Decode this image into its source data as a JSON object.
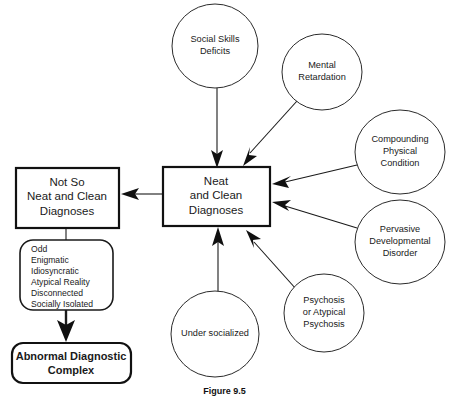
{
  "figure": {
    "caption": "Figure 9.5"
  },
  "nodes": {
    "center": {
      "id": "neat-and-clean-diagnoses",
      "shape": "rectangle",
      "lines": [
        "Neat",
        "and Clean",
        "Diagnoses"
      ]
    },
    "not_so": {
      "id": "not-so-neat-and-clean-diagnoses",
      "shape": "rectangle",
      "lines": [
        "Not So",
        "Neat and Clean",
        "Diagnoses"
      ]
    },
    "descriptors": {
      "id": "descriptor-list",
      "shape": "rounded-rectangle",
      "items": [
        "Odd",
        "Enigmatic",
        "Idiosyncratic",
        "Atypical Reality",
        "Disconnected",
        "Socially Isolated"
      ]
    },
    "outcome": {
      "id": "abnormal-diagnostic-complex",
      "shape": "rounded-rectangle",
      "lines": [
        "Abnormal Diagnostic",
        "Complex"
      ]
    },
    "circles": [
      {
        "id": "social-skills-deficits",
        "lines": [
          "Social Skills",
          "Deficits"
        ],
        "cx": 215,
        "cy": 46,
        "rx": 43,
        "ry": 42
      },
      {
        "id": "mental-retardation",
        "lines": [
          "Mental",
          "Retardation"
        ],
        "cx": 322,
        "cy": 72,
        "rx": 40,
        "ry": 38
      },
      {
        "id": "compounding-physical-condition",
        "lines": [
          "Compounding",
          "Physical",
          "Condition"
        ],
        "cx": 400,
        "cy": 152,
        "rx": 45,
        "ry": 42
      },
      {
        "id": "pervasive-developmental-disorder",
        "lines": [
          "Pervasive",
          "Developmental",
          "Disorder"
        ],
        "cx": 400,
        "cy": 242,
        "rx": 45,
        "ry": 42
      },
      {
        "id": "psychosis-or-atypical-psychosis",
        "lines": [
          "Psychosis",
          "or Atypical",
          "Psychosis"
        ],
        "cx": 324,
        "cy": 313,
        "rx": 40,
        "ry": 39
      },
      {
        "id": "under-socialized",
        "lines": [
          "Under socialized"
        ],
        "cx": 215,
        "cy": 334,
        "rx": 44,
        "ry": 43
      }
    ]
  },
  "edges": [
    {
      "id": "social-skills-to-center",
      "from": "social-skills-deficits",
      "to": "neat-and-clean-diagnoses",
      "arrow": true
    },
    {
      "id": "mental-retardation-to-center",
      "from": "mental-retardation",
      "to": "neat-and-clean-diagnoses",
      "arrow": true
    },
    {
      "id": "compounding-to-center",
      "from": "compounding-physical-condition",
      "to": "neat-and-clean-diagnoses",
      "arrow": true
    },
    {
      "id": "pervasive-to-center",
      "from": "pervasive-developmental-disorder",
      "to": "neat-and-clean-diagnoses",
      "arrow": true
    },
    {
      "id": "psychosis-to-center",
      "from": "psychosis-or-atypical-psychosis",
      "to": "neat-and-clean-diagnoses",
      "arrow": true
    },
    {
      "id": "under-socialized-to-center",
      "from": "under-socialized",
      "to": "neat-and-clean-diagnoses",
      "arrow": true
    },
    {
      "id": "center-to-not-so",
      "from": "neat-and-clean-diagnoses",
      "to": "not-so-neat-and-clean-diagnoses",
      "arrow": true
    },
    {
      "id": "not-so-to-descriptors",
      "from": "not-so-neat-and-clean-diagnoses",
      "to": "descriptor-list",
      "arrow": false
    },
    {
      "id": "descriptors-to-outcome",
      "from": "descriptor-list",
      "to": "abnormal-diagnostic-complex",
      "arrow": true
    }
  ]
}
